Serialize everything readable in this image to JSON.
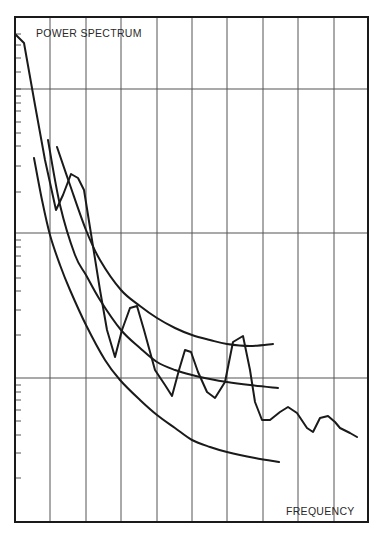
{
  "chart_data": {
    "type": "line",
    "title": "",
    "xlabel": "FREQUENCY",
    "ylabel": "POWER SPECTRUM",
    "y_scale": "log",
    "x_scale": "linear",
    "grid": true,
    "legend": null,
    "tick_labels": "none",
    "x_grid_divisions": 10,
    "y_decades": 3,
    "note": "Values in pixel coordinates of the plot (x: 15-368 left→right, y: 17-522 top→bottom); no numeric axis labels are shown.",
    "series": [
      {
        "name": "measured spectrum",
        "style": "jagged",
        "points": [
          [
            15,
            34
          ],
          [
            24,
            43
          ],
          [
            35,
            105
          ],
          [
            45,
            160
          ],
          [
            56,
            210
          ],
          [
            63,
            195
          ],
          [
            71,
            174
          ],
          [
            78,
            178
          ],
          [
            84,
            190
          ],
          [
            92,
            240
          ],
          [
            100,
            290
          ],
          [
            107,
            330
          ],
          [
            115,
            357
          ],
          [
            122,
            330
          ],
          [
            130,
            308
          ],
          [
            137,
            306
          ],
          [
            144,
            330
          ],
          [
            155,
            370
          ],
          [
            165,
            385
          ],
          [
            172,
            396
          ],
          [
            179,
            370
          ],
          [
            185,
            350
          ],
          [
            191,
            352
          ],
          [
            198,
            372
          ],
          [
            207,
            392
          ],
          [
            215,
            398
          ],
          [
            225,
            382
          ],
          [
            233,
            342
          ],
          [
            243,
            336
          ],
          [
            250,
            370
          ],
          [
            255,
            402
          ],
          [
            262,
            420
          ],
          [
            270,
            420
          ],
          [
            280,
            412
          ],
          [
            288,
            407
          ],
          [
            297,
            413
          ],
          [
            307,
            428
          ],
          [
            313,
            432
          ],
          [
            320,
            418
          ],
          [
            328,
            416
          ],
          [
            335,
            422
          ],
          [
            340,
            428
          ],
          [
            350,
            433
          ],
          [
            357,
            437
          ]
        ]
      },
      {
        "name": "upper envelope",
        "style": "smooth",
        "points": [
          [
            57,
            147
          ],
          [
            70,
            185
          ],
          [
            86,
            230
          ],
          [
            100,
            260
          ],
          [
            121,
            290
          ],
          [
            140,
            306
          ],
          [
            157,
            318
          ],
          [
            175,
            328
          ],
          [
            192,
            335
          ],
          [
            210,
            340
          ],
          [
            227,
            344
          ],
          [
            250,
            346
          ],
          [
            273,
            344
          ]
        ]
      },
      {
        "name": "mean trend",
        "style": "smooth",
        "points": [
          [
            48,
            140
          ],
          [
            60,
            205
          ],
          [
            75,
            255
          ],
          [
            86,
            275
          ],
          [
            100,
            300
          ],
          [
            121,
            330
          ],
          [
            140,
            348
          ],
          [
            157,
            362
          ],
          [
            175,
            370
          ],
          [
            192,
            375
          ],
          [
            210,
            379
          ],
          [
            227,
            382
          ],
          [
            250,
            385
          ],
          [
            278,
            388
          ]
        ]
      },
      {
        "name": "lower envelope",
        "style": "smooth",
        "points": [
          [
            34,
            158
          ],
          [
            42,
            200
          ],
          [
            50,
            235
          ],
          [
            60,
            265
          ],
          [
            70,
            290
          ],
          [
            86,
            325
          ],
          [
            105,
            360
          ],
          [
            120,
            380
          ],
          [
            140,
            400
          ],
          [
            157,
            415
          ],
          [
            175,
            428
          ],
          [
            192,
            440
          ],
          [
            210,
            447
          ],
          [
            227,
            452
          ],
          [
            255,
            458
          ],
          [
            279,
            462
          ]
        ]
      }
    ]
  },
  "labels": {
    "y_axis": "POWER SPECTRUM",
    "x_axis": "FREQUENCY"
  },
  "layout": {
    "frame": {
      "left": 15,
      "top": 17,
      "right": 368,
      "bottom": 522
    },
    "vgrid_x": [
      50,
      86,
      121,
      157,
      192,
      227,
      263,
      298,
      334
    ],
    "hgrid_y": [
      89,
      233,
      378
    ],
    "minor_ticks_y": [
      34,
      45,
      58,
      72,
      89,
      96,
      103,
      111,
      122,
      133,
      146,
      166,
      192,
      240,
      247,
      256,
      266,
      278,
      291,
      310,
      335,
      385,
      392,
      400,
      410,
      421,
      435,
      453,
      478
    ],
    "line_color": "#1a1a1a",
    "grid_color": "#555555"
  }
}
